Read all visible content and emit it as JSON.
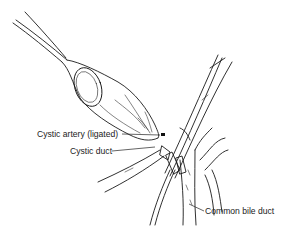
{
  "figure": {
    "type": "anatomical-line-drawing",
    "ink_color": "#1a1a1a",
    "background_color": "#ffffff"
  },
  "labels": [
    {
      "id": "cystic-artery",
      "text": "Cystic artery (ligated)",
      "x": 37,
      "y": 130
    },
    {
      "id": "cystic-duct",
      "text": "Cystic duct",
      "x": 70,
      "y": 147
    },
    {
      "id": "common-bile-duct",
      "text": "Common bile duct",
      "x": 205,
      "y": 207
    }
  ]
}
